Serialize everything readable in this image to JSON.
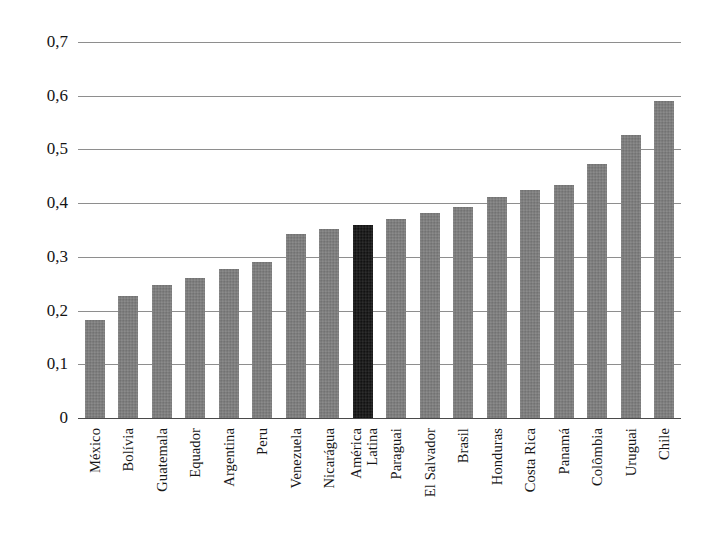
{
  "chart_data": {
    "type": "bar",
    "title": "",
    "subtitle": "",
    "xlabel": "",
    "ylabel": "",
    "ylim": [
      0,
      0.7
    ],
    "grid": true,
    "legend": false,
    "decimal_separator": ",",
    "ytick_labels": [
      "0,7",
      "0,6",
      "0,5",
      "0,4",
      "0,3",
      "0,2",
      "0,1",
      "0"
    ],
    "ytick_values": [
      0.7,
      0.6,
      0.5,
      0.4,
      0.3,
      0.2,
      0.1,
      0
    ],
    "categories": [
      "México",
      "Bolívia",
      "Guatemala",
      "Equador",
      "Argentina",
      "Peru",
      "Venezuela",
      "Nicarágua",
      "América Latina",
      "Paraguai",
      "El Salvador",
      "Brasil",
      "Honduras",
      "Costa Rica",
      "Panamá",
      "Colômbia",
      "Uruguai",
      "Chile"
    ],
    "category_lines": [
      [
        "México"
      ],
      [
        "Bolívia"
      ],
      [
        "Guatemala"
      ],
      [
        "Equador"
      ],
      [
        "Argentina"
      ],
      [
        "Peru"
      ],
      [
        "Venezuela"
      ],
      [
        "Nicarágua"
      ],
      [
        "América",
        "Latina"
      ],
      [
        "Paraguai"
      ],
      [
        "El Salvador"
      ],
      [
        "Brasil"
      ],
      [
        "Honduras"
      ],
      [
        "Costa Rica"
      ],
      [
        "Panamá"
      ],
      [
        "Colômbia"
      ],
      [
        "Uruguai"
      ],
      [
        "Chile"
      ]
    ],
    "values": [
      0.183,
      0.228,
      0.248,
      0.26,
      0.278,
      0.29,
      0.342,
      0.351,
      0.36,
      0.37,
      0.382,
      0.392,
      0.412,
      0.424,
      0.434,
      0.473,
      0.527,
      0.59
    ],
    "highlight_index": 8,
    "colors": {
      "bar": "#7d7d7d",
      "bar_highlight": "#141414",
      "gridline": "#8e8e8e",
      "axis": "#4a4a4a",
      "background": "#ffffff",
      "text": "#161616"
    }
  }
}
